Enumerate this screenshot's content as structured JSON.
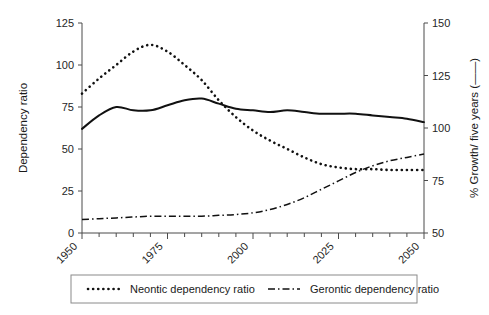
{
  "chart_data": {
    "type": "line",
    "title": "",
    "subtitle": "",
    "xlabel": "",
    "ylabel": "Dependency ratio",
    "y2label": "% Growth/ five years (——)",
    "xlim": [
      1950,
      2050
    ],
    "ylim": [
      0,
      125
    ],
    "y2lim": [
      50,
      150
    ],
    "grid": false,
    "legend_position": "bottom",
    "xticks": [
      1950,
      1975,
      2000,
      2025,
      2050
    ],
    "xtick_labels": [
      "1950",
      "1975",
      "2000",
      "2025",
      "2050"
    ],
    "xtick_minor_step": 5,
    "yticks": [
      0,
      25,
      50,
      75,
      100,
      125
    ],
    "ytick_labels": [
      "0",
      "25",
      "50",
      "75",
      "100",
      "125"
    ],
    "y2ticks": [
      50,
      75,
      100,
      125,
      150
    ],
    "y2tick_labels": [
      "50",
      "75",
      "100",
      "125",
      "150"
    ],
    "x": [
      1950,
      1955,
      1960,
      1965,
      1970,
      1975,
      1980,
      1985,
      1990,
      1995,
      2000,
      2005,
      2010,
      2015,
      2020,
      2025,
      2030,
      2035,
      2040,
      2045,
      2050
    ],
    "series": [
      {
        "name": "Neontic dependency ratio",
        "axis": "left",
        "style": "dotted",
        "color": "#111111",
        "values": [
          83,
          92,
          100,
          108,
          112,
          108,
          100,
          91,
          79,
          69,
          61,
          55,
          50,
          45,
          41,
          39,
          38,
          38,
          37.5,
          37.5,
          37.5
        ]
      },
      {
        "name": "Gerontic dependency ratio",
        "axis": "left",
        "style": "dash-dot",
        "color": "#111111",
        "values": [
          8,
          8.5,
          9,
          9.5,
          10,
          10,
          10,
          10,
          10.5,
          11,
          12,
          14,
          17,
          21,
          26,
          31,
          36,
          40,
          43,
          45,
          47
        ]
      },
      {
        "name": "% Growth/ five years",
        "axis": "right",
        "style": "solid",
        "color": "#111111",
        "values_left_scale": [
          62,
          70,
          75,
          73,
          73,
          76,
          79,
          80,
          77,
          74,
          73,
          72,
          73,
          72,
          71,
          71,
          71,
          70,
          69,
          68,
          66
        ],
        "values": [
          99.6,
          106,
          110,
          108.4,
          108.4,
          110.8,
          113.2,
          114,
          111.6,
          109.2,
          108.4,
          107.6,
          108.4,
          107.6,
          106.8,
          106.8,
          106.8,
          106,
          105.2,
          104.4,
          102.8
        ]
      }
    ],
    "legend": [
      {
        "label": "Neontic dependency ratio",
        "style": "dotted"
      },
      {
        "label": "Gerontic dependency ratio",
        "style": "dash-dot"
      }
    ]
  },
  "colors": {
    "ink": "#111111",
    "axis": "#4a4a4a",
    "legend_border": "#8a8a8a",
    "background": "#ffffff"
  }
}
